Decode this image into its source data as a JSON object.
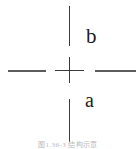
{
  "figure": {
    "caption": "图1.36-3  结构示意",
    "labels": {
      "upper": "b",
      "lower": "a"
    },
    "colors": {
      "background": "#ffffff",
      "line": "#3a3a3a",
      "dash": "#5b5b5b",
      "label": "#1c1c1c",
      "caption": "#b9b9b9"
    },
    "elements": {
      "dash_left": "horizontal-centerline-left-segment",
      "dash_right": "horizontal-centerline-right-segment",
      "dash_top": "vertical-centerline-top-segment",
      "dash_bottom": "vertical-centerline-bottom-segment",
      "cross": "center-crosshair-mark"
    }
  }
}
